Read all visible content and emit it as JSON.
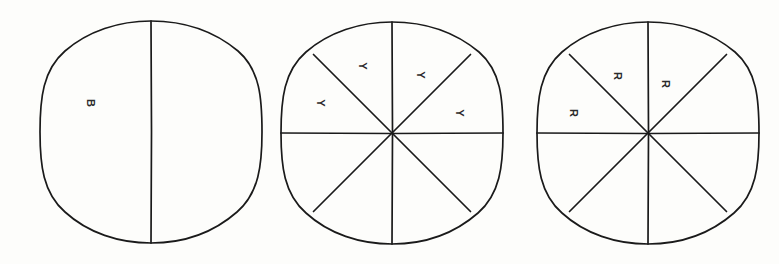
{
  "figure": {
    "background_color": "#fdfdfb",
    "ink_color": "#1a1a1a",
    "label_rotation_degrees": 90,
    "circles": [
      {
        "id": "circle-1",
        "center_x": 151,
        "center_y": 132,
        "radius": 111,
        "total_sectors": 2,
        "divider_angles_degrees": [
          90,
          270
        ],
        "labels": [
          {
            "text": "B",
            "x": 90,
            "y": 103,
            "sector_index": 0
          }
        ],
        "shaded_count": 1
      },
      {
        "id": "circle-2",
        "center_x": 392,
        "center_y": 133,
        "radius": 111,
        "total_sectors": 8,
        "divider_angles_degrees": [
          0,
          45,
          90,
          135,
          180,
          225,
          270,
          315
        ],
        "labels": [
          {
            "text": "Y",
            "x": 320,
            "y": 103,
            "sector_index": 0
          },
          {
            "text": "Y",
            "x": 362,
            "y": 66,
            "sector_index": 1
          },
          {
            "text": "Y",
            "x": 420,
            "y": 75,
            "sector_index": 2
          },
          {
            "text": "Y",
            "x": 459,
            "y": 113,
            "sector_index": 3
          }
        ],
        "shaded_count": 4
      },
      {
        "id": "circle-3",
        "center_x": 648,
        "center_y": 133,
        "radius": 111,
        "total_sectors": 8,
        "divider_angles_degrees": [
          0,
          45,
          90,
          135,
          180,
          225,
          270,
          315
        ],
        "labels": [
          {
            "text": "R",
            "x": 573,
            "y": 113,
            "sector_index": 0
          },
          {
            "text": "R",
            "x": 617,
            "y": 76,
            "sector_index": 1
          },
          {
            "text": "R",
            "x": 665,
            "y": 84,
            "sector_index": 2
          }
        ],
        "shaded_count": 3
      }
    ]
  }
}
